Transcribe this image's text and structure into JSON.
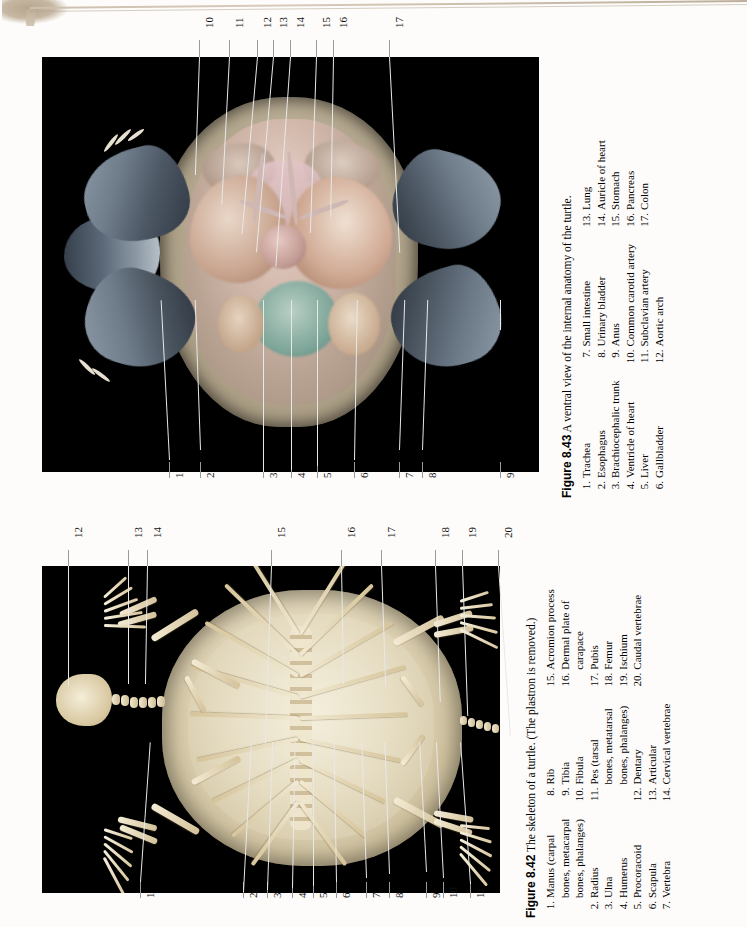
{
  "page": {
    "running_head": "",
    "background": "#fdfcfa",
    "plate_background": "#000000"
  },
  "figure_843": {
    "id": "fig-8-43",
    "number": "Figure 8.43",
    "caption": "A ventral view of the internal anatomy of the turtle.",
    "legend": [
      {
        "n": "1.",
        "label": "Trachea"
      },
      {
        "n": "2.",
        "label": "Esophagus"
      },
      {
        "n": "3.",
        "label": "Brachiocephalic trunk"
      },
      {
        "n": "4.",
        "label": "Ventricle of heart"
      },
      {
        "n": "5.",
        "label": "Liver"
      },
      {
        "n": "6.",
        "label": "Gallbladder"
      },
      {
        "n": "7.",
        "label": "Small intestine"
      },
      {
        "n": "8.",
        "label": "Urinary bladder"
      },
      {
        "n": "9.",
        "label": "Anus"
      },
      {
        "n": "10.",
        "label": "Common carotid artery"
      },
      {
        "n": "11.",
        "label": "Subclavian artery"
      },
      {
        "n": "12.",
        "label": "Aortic arch"
      },
      {
        "n": "13.",
        "label": "Lung"
      },
      {
        "n": "14.",
        "label": "Auricle of heart"
      },
      {
        "n": "15.",
        "label": "Stomach"
      },
      {
        "n": "16.",
        "label": "Pancreas"
      },
      {
        "n": "17.",
        "label": "Colon"
      }
    ],
    "callouts_top": [
      {
        "label": "10",
        "x": 199
      },
      {
        "label": "11",
        "x": 229
      },
      {
        "label": "12",
        "x": 257
      },
      {
        "label": "13",
        "x": 273
      },
      {
        "label": "14",
        "x": 290
      },
      {
        "label": "15",
        "x": 316
      },
      {
        "label": "16",
        "x": 333
      },
      {
        "label": "17",
        "x": 389
      }
    ],
    "callouts_bottom": [
      {
        "label": "1",
        "x": 169
      },
      {
        "label": "2",
        "x": 200
      },
      {
        "label": "3",
        "x": 263
      },
      {
        "label": "4",
        "x": 291
      },
      {
        "label": "5",
        "x": 317
      },
      {
        "label": "6",
        "x": 354
      },
      {
        "label": "7",
        "x": 399
      },
      {
        "label": "8",
        "x": 422
      },
      {
        "label": "9",
        "x": 500
      }
    ]
  },
  "figure_842": {
    "id": "fig-8-42",
    "number": "Figure 8.42",
    "caption": "The skeleton of a turtle. (The plastron is removed.)",
    "legend_col1": [
      {
        "n": "1.",
        "label": "Manus (carpal"
      },
      {
        "n": "",
        "label": "bones, metacarpal"
      },
      {
        "n": "",
        "label": "bones, phalanges)"
      },
      {
        "n": "2.",
        "label": "Radius"
      },
      {
        "n": "3.",
        "label": "Ulna"
      },
      {
        "n": "4.",
        "label": "Humerus"
      },
      {
        "n": "5.",
        "label": "Procoracoid"
      },
      {
        "n": "6.",
        "label": "Scapula"
      },
      {
        "n": "7.",
        "label": "Vertebra"
      }
    ],
    "legend_col2": [
      {
        "n": "8.",
        "label": "Rib"
      },
      {
        "n": "9.",
        "label": "Tibia"
      },
      {
        "n": "10.",
        "label": "Fibula"
      },
      {
        "n": "11.",
        "label": "Pes (tarsal"
      },
      {
        "n": "",
        "label": "bones, metatarsal"
      },
      {
        "n": "",
        "label": "bones, phalanges)"
      },
      {
        "n": "12.",
        "label": "Dentary"
      },
      {
        "n": "13.",
        "label": "Articular"
      },
      {
        "n": "14.",
        "label": "Cervical vertebrae"
      }
    ],
    "legend_col3": [
      {
        "n": "15.",
        "label": "Acromion process"
      },
      {
        "n": "16.",
        "label": "Dermal plate of"
      },
      {
        "n": "",
        "label": "carapace"
      },
      {
        "n": "17.",
        "label": "Pubis"
      },
      {
        "n": "18.",
        "label": "Femur"
      },
      {
        "n": "19.",
        "label": "Ischium"
      },
      {
        "n": "20.",
        "label": "Caudal vertebrae"
      }
    ],
    "callouts_top": [
      {
        "label": "12",
        "x": 68
      },
      {
        "label": "13",
        "x": 128
      },
      {
        "label": "14",
        "x": 147
      },
      {
        "label": "15",
        "x": 271
      },
      {
        "label": "16",
        "x": 341
      },
      {
        "label": "17",
        "x": 381
      },
      {
        "label": "18",
        "x": 435
      },
      {
        "label": "19",
        "x": 462
      },
      {
        "label": "20",
        "x": 498
      }
    ],
    "callouts_bottom": [
      {
        "label": "1",
        "x": 140
      },
      {
        "label": "2",
        "x": 243
      },
      {
        "label": "3",
        "x": 267
      },
      {
        "label": "4",
        "x": 292
      },
      {
        "label": "5",
        "x": 313
      },
      {
        "label": "6",
        "x": 336
      },
      {
        "label": "7",
        "x": 366
      },
      {
        "label": "8",
        "x": 389
      },
      {
        "label": "9",
        "x": 426
      },
      {
        "label": "10",
        "x": 443
      },
      {
        "label": "11",
        "x": 470
      }
    ]
  }
}
